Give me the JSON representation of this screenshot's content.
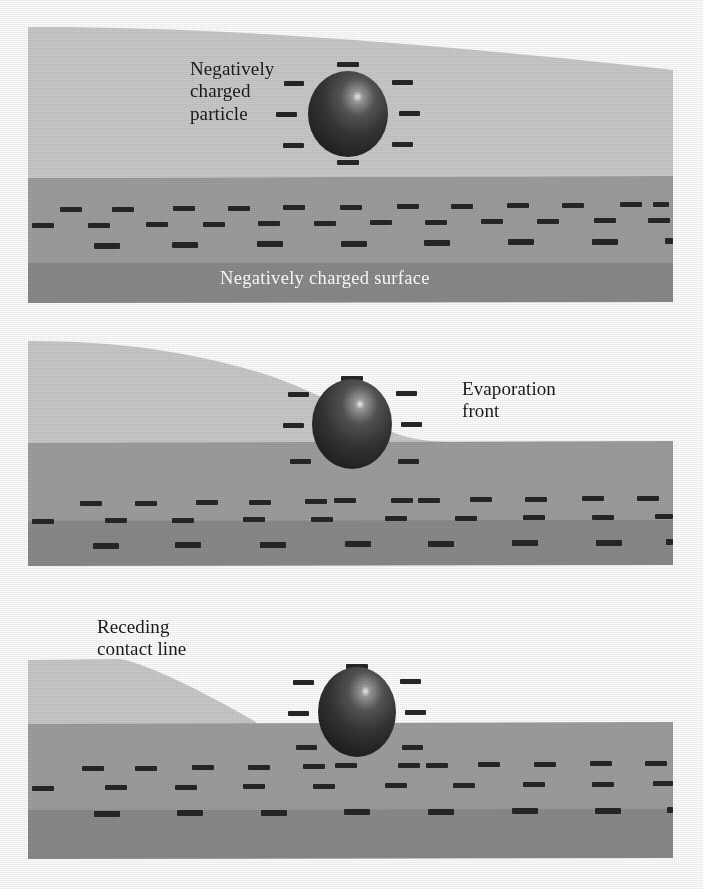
{
  "figure": {
    "kind": "three-stage-schematic-diagram",
    "width": 703,
    "height": 889
  },
  "colors": {
    "background": "#fdfdfc",
    "vapor_layer": "#c9c9c7",
    "liquid_layer": "#9e9e9c",
    "substrate_band": "#8a8a88",
    "charge_mark": "#262626",
    "particle_dark": "#2e2e2e",
    "particle_mid": "#4a4a4a",
    "particle_highlight": "#e8e8e8",
    "label_text": "#1a1a1a",
    "label_text_inverse": "#ffffff"
  },
  "panels": [
    {
      "id": "panel-1",
      "stage": "initial",
      "labels": {
        "particle": "Negatively\ncharged\nparticle",
        "surface": "Negatively charged surface"
      },
      "particle": {
        "cx": 348,
        "cy": 114,
        "rx": 40,
        "ry": 43,
        "charges": 8
      },
      "charge_rows": 3,
      "charges_per_row": 12
    },
    {
      "id": "panel-2",
      "stage": "evaporating",
      "labels": {
        "front": "Evaporation\nfront"
      },
      "particle": {
        "cx": 352,
        "cy": 424,
        "rx": 40,
        "ry": 45,
        "charges": 8
      },
      "charge_rows": 3,
      "charges_per_row": 12
    },
    {
      "id": "panel-3",
      "stage": "receding",
      "labels": {
        "contact_line": "Receding\ncontact line"
      },
      "particle": {
        "cx": 357,
        "cy": 712,
        "rx": 39,
        "ry": 45,
        "charges": 8
      },
      "charge_rows": 3,
      "charges_per_row": 12
    }
  ],
  "legend": {
    "minus_sign": "minus-charge-mark",
    "particle_name": "charged-particle-sphere"
  }
}
